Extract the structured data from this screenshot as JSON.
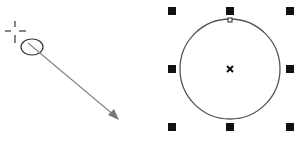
{
  "diagram": {
    "colors": {
      "stroke": "#333333",
      "arrow": "#888888",
      "handle": "#111111",
      "background": "#ffffff"
    },
    "left": {
      "cursor": "crosshair-icon",
      "start_ellipse": "ellipse-icon",
      "drag_arrow": "arrow"
    },
    "right": {
      "shape": "circle",
      "center_marker": "x-center-icon",
      "handles": 8,
      "node": "top-node"
    }
  }
}
